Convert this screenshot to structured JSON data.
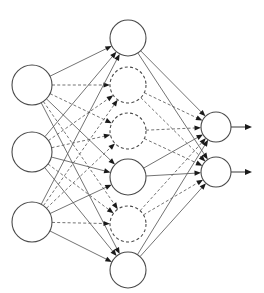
{
  "diagram": {
    "type": "neural-network",
    "canvas": {
      "width": 264,
      "height": 293,
      "background": "#ffffff"
    },
    "style": {
      "node_fill": "#ffffff",
      "node_stroke": "#4a4a4a",
      "edge_stroke": "#5a5a5a",
      "arrowhead_fill": "#1a1a1a",
      "solid_dash": "none",
      "dashed_dash": "3 2.4"
    },
    "layers": [
      {
        "id": "input",
        "name": "input-layer",
        "label": "",
        "x": 32,
        "radius": 20,
        "nodes": [
          {
            "id": "i1",
            "label": "",
            "cy": 85,
            "style": "solid"
          },
          {
            "id": "i2",
            "label": "",
            "cy": 152,
            "style": "solid"
          },
          {
            "id": "i3",
            "label": "",
            "cy": 222,
            "style": "solid"
          }
        ]
      },
      {
        "id": "hidden",
        "name": "hidden-layer",
        "label": "",
        "x": 128,
        "radius": 18,
        "nodes": [
          {
            "id": "h1",
            "label": "",
            "cy": 38,
            "style": "solid"
          },
          {
            "id": "h2",
            "label": "",
            "cy": 85,
            "style": "dashed"
          },
          {
            "id": "h3",
            "label": "",
            "cy": 131,
            "style": "dashed"
          },
          {
            "id": "h4",
            "label": "",
            "cy": 177,
            "style": "solid"
          },
          {
            "id": "h5",
            "label": "",
            "cy": 224,
            "style": "dashed"
          },
          {
            "id": "h6",
            "label": "",
            "cy": 270,
            "style": "solid"
          }
        ]
      },
      {
        "id": "output",
        "name": "output-layer",
        "label": "",
        "x": 216,
        "radius": 15,
        "nodes": [
          {
            "id": "o1",
            "label": "",
            "cy": 127,
            "style": "solid"
          },
          {
            "id": "o2",
            "label": "",
            "cy": 172,
            "style": "solid"
          }
        ]
      }
    ],
    "edges_input_hidden": [
      {
        "from": "i1",
        "to": "h1",
        "style": "solid"
      },
      {
        "from": "i1",
        "to": "h2",
        "style": "dashed"
      },
      {
        "from": "i1",
        "to": "h3",
        "style": "dashed"
      },
      {
        "from": "i1",
        "to": "h4",
        "style": "solid"
      },
      {
        "from": "i1",
        "to": "h5",
        "style": "dashed"
      },
      {
        "from": "i1",
        "to": "h6",
        "style": "solid"
      },
      {
        "from": "i2",
        "to": "h1",
        "style": "solid"
      },
      {
        "from": "i2",
        "to": "h2",
        "style": "dashed"
      },
      {
        "from": "i2",
        "to": "h3",
        "style": "dashed"
      },
      {
        "from": "i2",
        "to": "h4",
        "style": "solid"
      },
      {
        "from": "i2",
        "to": "h5",
        "style": "dashed"
      },
      {
        "from": "i2",
        "to": "h6",
        "style": "solid"
      },
      {
        "from": "i3",
        "to": "h1",
        "style": "solid"
      },
      {
        "from": "i3",
        "to": "h2",
        "style": "dashed"
      },
      {
        "from": "i3",
        "to": "h3",
        "style": "dashed"
      },
      {
        "from": "i3",
        "to": "h4",
        "style": "solid"
      },
      {
        "from": "i3",
        "to": "h5",
        "style": "dashed"
      },
      {
        "from": "i3",
        "to": "h6",
        "style": "solid"
      }
    ],
    "edges_hidden_output": [
      {
        "from": "h1",
        "to": "o1",
        "style": "solid"
      },
      {
        "from": "h1",
        "to": "o2",
        "style": "solid"
      },
      {
        "from": "h2",
        "to": "o1",
        "style": "dashed"
      },
      {
        "from": "h2",
        "to": "o2",
        "style": "dashed"
      },
      {
        "from": "h3",
        "to": "o1",
        "style": "dashed"
      },
      {
        "from": "h3",
        "to": "o2",
        "style": "dashed"
      },
      {
        "from": "h4",
        "to": "o1",
        "style": "solid"
      },
      {
        "from": "h4",
        "to": "o2",
        "style": "solid"
      },
      {
        "from": "h5",
        "to": "o1",
        "style": "dashed"
      },
      {
        "from": "h5",
        "to": "o2",
        "style": "dashed"
      },
      {
        "from": "h6",
        "to": "o1",
        "style": "solid"
      },
      {
        "from": "h6",
        "to": "o2",
        "style": "solid"
      }
    ],
    "output_arrows": [
      {
        "from": "o1",
        "x_end": 252,
        "style": "solid"
      },
      {
        "from": "o2",
        "x_end": 252,
        "style": "solid"
      }
    ]
  }
}
